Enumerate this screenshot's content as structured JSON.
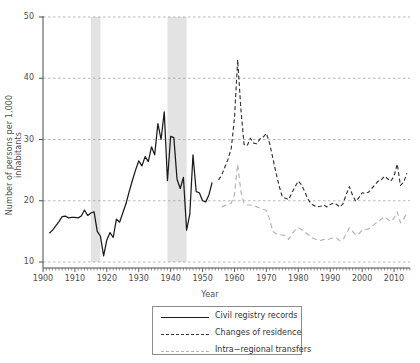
{
  "chart_data": {
    "type": "line",
    "title": "",
    "xlabel": "Year",
    "ylabel": "Number of persons per 1,000 inhabitants",
    "xlim": [
      1900,
      2015
    ],
    "ylim": [
      10,
      50
    ],
    "xticks": [
      1900,
      1910,
      1920,
      1930,
      1940,
      1950,
      1960,
      1970,
      1980,
      1990,
      2000,
      2010
    ],
    "yticks": [
      10,
      20,
      30,
      40,
      50
    ],
    "grid": "horizontal-dashed",
    "legend_position": "bottom-center",
    "shaded_bands": [
      {
        "name": "world-war-one",
        "x0": 1915,
        "x1": 1918
      },
      {
        "name": "world-war-two",
        "x0": 1939,
        "x1": 1945
      }
    ],
    "series": [
      {
        "name": "Civil registry records",
        "style": "solid",
        "color": "#1a1a1a",
        "x": [
          1902,
          1903,
          1904,
          1905,
          1906,
          1907,
          1908,
          1909,
          1910,
          1911,
          1912,
          1913,
          1914,
          1915,
          1916,
          1917,
          1918,
          1919,
          1920,
          1921,
          1922,
          1923,
          1924,
          1925,
          1926,
          1927,
          1928,
          1929,
          1930,
          1931,
          1932,
          1933,
          1934,
          1935,
          1936,
          1937,
          1938,
          1939,
          1940,
          1941,
          1942,
          1943,
          1944,
          1945,
          1946,
          1947,
          1948,
          1949,
          1950,
          1951,
          1952,
          1953
        ],
        "values": [
          14.7,
          15.2,
          15.9,
          16.6,
          17.4,
          17.5,
          17.2,
          17.3,
          17.3,
          17.2,
          17.5,
          18.5,
          17.6,
          18.0,
          18.2,
          15.0,
          14.2,
          11.0,
          13.6,
          14.8,
          14.0,
          17.0,
          16.5,
          18.0,
          19.5,
          21.5,
          23.3,
          25.0,
          26.5,
          25.7,
          27.2,
          26.4,
          28.8,
          27.5,
          32.6,
          30.0,
          34.5,
          23.3,
          30.5,
          30.3,
          23.5,
          22.0,
          23.8,
          15.2,
          17.8,
          27.5,
          21.5,
          21.3,
          20.0,
          19.8,
          21.0,
          23.0
        ]
      },
      {
        "name": "Changes of residence",
        "style": "dashed",
        "color": "#333333",
        "x": [
          1955,
          1956,
          1957,
          1958,
          1959,
          1960,
          1961,
          1962,
          1963,
          1964,
          1965,
          1966,
          1967,
          1968,
          1969,
          1970,
          1971,
          1972,
          1973,
          1974,
          1975,
          1976,
          1977,
          1978,
          1979,
          1980,
          1981,
          1982,
          1983,
          1984,
          1985,
          1986,
          1987,
          1988,
          1989,
          1990,
          1991,
          1992,
          1993,
          1994,
          1995,
          1996,
          1997,
          1998,
          1999,
          2000,
          2001,
          2002,
          2003,
          2004,
          2005,
          2006,
          2007,
          2008,
          2009,
          2010,
          2011,
          2012,
          2013,
          2014
        ],
        "values": [
          23.4,
          24.2,
          25.5,
          26.8,
          28.6,
          33.5,
          43.0,
          35.0,
          29.2,
          29.0,
          30.2,
          29.4,
          29.3,
          30.1,
          30.4,
          31.0,
          29.4,
          27.0,
          24.6,
          22.4,
          20.6,
          20.4,
          20.2,
          21.3,
          22.3,
          23.2,
          22.6,
          21.5,
          20.3,
          19.5,
          19.2,
          19.0,
          19.1,
          19.3,
          19.0,
          19.4,
          19.6,
          19.4,
          19.0,
          19.5,
          21.0,
          22.3,
          20.9,
          19.9,
          20.5,
          21.3,
          21.2,
          21.4,
          22.0,
          22.6,
          23.2,
          23.4,
          24.0,
          23.6,
          23.2,
          24.0,
          26.0,
          22.5,
          23.0,
          24.5
        ]
      },
      {
        "name": "Intra−regional transfers",
        "style": "dashed-light",
        "color": "#b3b3b3",
        "x": [
          1956,
          1957,
          1958,
          1959,
          1960,
          1961,
          1962,
          1963,
          1964,
          1965,
          1966,
          1967,
          1968,
          1969,
          1970,
          1971,
          1972,
          1973,
          1974,
          1975,
          1976,
          1977,
          1978,
          1979,
          1980,
          1981,
          1982,
          1983,
          1984,
          1985,
          1986,
          1987,
          1988,
          1989,
          1990,
          1991,
          1992,
          1993,
          1994,
          1995,
          1996,
          1997,
          1998,
          1999,
          2000,
          2001,
          2002,
          2003,
          2004,
          2005,
          2006,
          2007,
          2008,
          2009,
          2010,
          2011,
          2012,
          2013,
          2014
        ],
        "values": [
          19.0,
          19.2,
          19.4,
          19.6,
          21.0,
          26.0,
          21.5,
          19.5,
          19.3,
          19.3,
          19.2,
          19.0,
          18.8,
          18.6,
          18.4,
          17.0,
          15.0,
          14.6,
          14.5,
          14.4,
          14.3,
          13.7,
          14.6,
          15.2,
          15.6,
          15.3,
          14.9,
          14.5,
          14.0,
          13.8,
          13.6,
          13.5,
          13.7,
          13.6,
          13.8,
          14.0,
          13.9,
          13.5,
          13.6,
          14.6,
          15.6,
          15.0,
          14.4,
          14.6,
          15.2,
          15.3,
          15.4,
          15.8,
          16.2,
          16.6,
          17.0,
          17.4,
          17.0,
          16.6,
          17.2,
          18.2,
          16.4,
          17.0,
          18.0
        ]
      }
    ]
  },
  "legend": {
    "items": [
      {
        "label": "Civil registry records"
      },
      {
        "label": "Changes of residence"
      },
      {
        "label": "Intra−regional transfers"
      }
    ]
  }
}
